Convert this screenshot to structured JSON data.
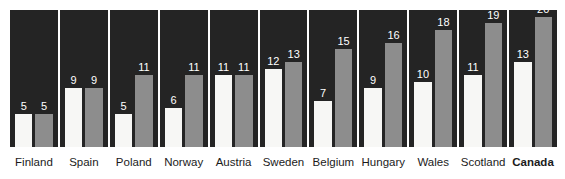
{
  "chart_data": {
    "type": "bar",
    "title": "",
    "subtitle": "",
    "xlabel": "",
    "ylabel": "",
    "grid": false,
    "legend_position": "none",
    "ylim": [
      0,
      21
    ],
    "categories": [
      "Finland",
      "Spain",
      "Poland",
      "Norway",
      "Austria",
      "Sweden",
      "Belgium",
      "Hungary",
      "Wales",
      "Scotland",
      "Canada"
    ],
    "series": [
      {
        "name": "white",
        "values": [
          5,
          9,
          5,
          6,
          11,
          12,
          7,
          9,
          10,
          11,
          13
        ]
      },
      {
        "name": "grey",
        "values": [
          5,
          9,
          11,
          11,
          11,
          13,
          15,
          16,
          18,
          19,
          20
        ]
      }
    ],
    "emphasized_category": "Canada",
    "colors": {
      "panel_background": "#242424",
      "bar_white": "#f7f7f5",
      "bar_grey": "#8d8d8d",
      "value_label": "#ffffff",
      "category_label": "#1b1b1b",
      "page_background": "#ffffff"
    }
  },
  "panels": [
    {
      "label": "Finland",
      "white": 5,
      "grey": 5,
      "emphasis": false
    },
    {
      "label": "Spain",
      "white": 9,
      "grey": 9,
      "emphasis": false
    },
    {
      "label": "Poland",
      "white": 5,
      "grey": 11,
      "emphasis": false
    },
    {
      "label": "Norway",
      "white": 6,
      "grey": 11,
      "emphasis": false
    },
    {
      "label": "Austria",
      "white": 11,
      "grey": 11,
      "emphasis": false
    },
    {
      "label": "Sweden",
      "white": 12,
      "grey": 13,
      "emphasis": false
    },
    {
      "label": "Belgium",
      "white": 7,
      "grey": 15,
      "emphasis": false
    },
    {
      "label": "Hungary",
      "white": 9,
      "grey": 16,
      "emphasis": false
    },
    {
      "label": "Wales",
      "white": 10,
      "grey": 18,
      "emphasis": false
    },
    {
      "label": "Scotland",
      "white": 11,
      "grey": 19,
      "emphasis": false
    },
    {
      "label": "Canada",
      "white": 13,
      "grey": 20,
      "emphasis": true
    }
  ]
}
